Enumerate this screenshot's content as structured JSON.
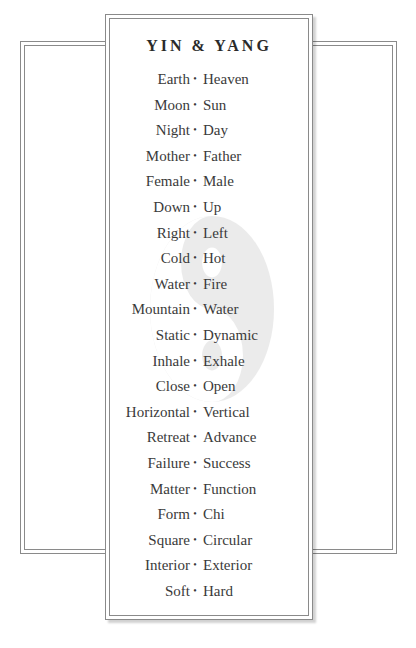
{
  "title": "YIN & YANG",
  "separator": "•",
  "pairs": [
    {
      "yin": "Earth",
      "yang": "Heaven"
    },
    {
      "yin": "Moon",
      "yang": "Sun"
    },
    {
      "yin": "Night",
      "yang": "Day"
    },
    {
      "yin": "Mother",
      "yang": "Father"
    },
    {
      "yin": "Female",
      "yang": "Male"
    },
    {
      "yin": "Down",
      "yang": "Up"
    },
    {
      "yin": "Right",
      "yang": "Left"
    },
    {
      "yin": "Cold",
      "yang": "Hot"
    },
    {
      "yin": "Water",
      "yang": "Fire"
    },
    {
      "yin": "Mountain",
      "yang": "Water"
    },
    {
      "yin": "Static",
      "yang": "Dynamic"
    },
    {
      "yin": "Inhale",
      "yang": "Exhale"
    },
    {
      "yin": "Close",
      "yang": "Open"
    },
    {
      "yin": "Horizontal",
      "yang": "Vertical"
    },
    {
      "yin": "Retreat",
      "yang": "Advance"
    },
    {
      "yin": "Failure",
      "yang": "Success"
    },
    {
      "yin": "Matter",
      "yang": "Function"
    },
    {
      "yin": "Form",
      "yang": "Chi"
    },
    {
      "yin": "Square",
      "yang": "Circular"
    },
    {
      "yin": "Interior",
      "yang": "Exterior"
    },
    {
      "yin": "Soft",
      "yang": "Hard"
    }
  ],
  "watermark_icon": "yin-yang-icon"
}
